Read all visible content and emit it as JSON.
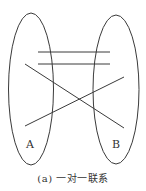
{
  "diagram": {
    "type": "set-mapping",
    "sets": [
      {
        "label": "A",
        "cx": 31,
        "cy": 89,
        "rx": 22.5,
        "ry": 76
      },
      {
        "label": "B",
        "cx": 116,
        "cy": 89.5,
        "rx": 23,
        "ry": 74.5
      }
    ],
    "mappings": [
      {
        "x1": 38,
        "y1": 52,
        "x2": 110,
        "y2": 52
      },
      {
        "x1": 38,
        "y1": 64,
        "x2": 110,
        "y2": 64
      },
      {
        "x1": 25,
        "y1": 64,
        "x2": 124,
        "y2": 128
      },
      {
        "x1": 25,
        "y1": 126,
        "x2": 124,
        "y2": 77
      }
    ],
    "stroke_color": "#3a3a3a",
    "caption": "(a) 一对一联系"
  }
}
